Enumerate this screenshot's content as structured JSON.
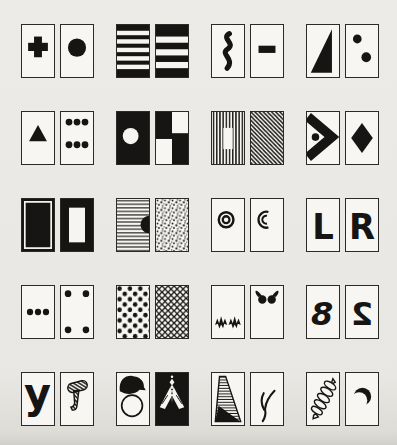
{
  "figure": {
    "kind": "symbol-card-pairs-figure",
    "rows_count": 5,
    "pairs_per_row": 4,
    "cards_per_pair": 2
  },
  "colors": {
    "paper": "#e9e7e3",
    "card": "#f7f6f3",
    "ink": "#161513",
    "border": "#2b2a28",
    "stripe_white": "#f6f5f1"
  },
  "rows": [
    {
      "pairs": [
        {
          "cards": [
            {
              "symbol": "plus"
            },
            {
              "symbol": "filled-circle"
            }
          ]
        },
        {
          "cards": [
            {
              "symbol": "h-stripes-5"
            },
            {
              "symbol": "h-stripes-3"
            }
          ]
        },
        {
          "cards": [
            {
              "symbol": "vertical-squiggle"
            },
            {
              "symbol": "minus-bar"
            }
          ]
        },
        {
          "cards": [
            {
              "symbol": "half-filled-triangle"
            },
            {
              "symbol": "two-dots-diagonal"
            }
          ]
        }
      ]
    },
    {
      "pairs": [
        {
          "cards": [
            {
              "symbol": "triangle-up"
            },
            {
              "symbol": "six-dots"
            }
          ]
        },
        {
          "cards": [
            {
              "symbol": "circle-on-black"
            },
            {
              "symbol": "checkerboard"
            }
          ]
        },
        {
          "cards": [
            {
              "symbol": "vertical-stripes-window"
            },
            {
              "symbol": "diagonal-stripes"
            }
          ]
        },
        {
          "cards": [
            {
              "symbol": "chevron-right-dot"
            },
            {
              "symbol": "diamond"
            }
          ]
        }
      ]
    },
    {
      "pairs": [
        {
          "cards": [
            {
              "symbol": "black-inset-frame"
            },
            {
              "symbol": "thick-black-border"
            }
          ]
        },
        {
          "cards": [
            {
              "symbol": "h-lines-notch"
            },
            {
              "symbol": "stipple"
            }
          ]
        },
        {
          "cards": [
            {
              "symbol": "concentric-rings"
            },
            {
              "symbol": "concentric-arcs"
            }
          ]
        },
        {
          "cards": [
            {
              "symbol": "letter",
              "glyph": "L"
            },
            {
              "symbol": "letter",
              "glyph": "R"
            }
          ]
        }
      ]
    },
    {
      "pairs": [
        {
          "cards": [
            {
              "symbol": "three-dots-row"
            },
            {
              "symbol": "four-dots-corners"
            }
          ]
        },
        {
          "cards": [
            {
              "symbol": "polka-dots"
            },
            {
              "symbol": "crosshatch-lattice"
            }
          ]
        },
        {
          "cards": [
            {
              "symbol": "zigzag-marks"
            },
            {
              "symbol": "butterfly"
            }
          ]
        },
        {
          "cards": [
            {
              "symbol": "letter-italic",
              "glyph": "8"
            },
            {
              "symbol": "letter-mirrored",
              "glyph": "2"
            }
          ]
        }
      ]
    },
    {
      "pairs": [
        {
          "cards": [
            {
              "symbol": "letter-lowercase",
              "glyph": "y"
            },
            {
              "symbol": "hatched-mallet"
            }
          ]
        },
        {
          "cards": [
            {
              "symbol": "bird"
            },
            {
              "symbol": "moth-on-black"
            }
          ]
        },
        {
          "cards": [
            {
              "symbol": "striped-wedge"
            },
            {
              "symbol": "twig"
            }
          ]
        },
        {
          "cards": [
            {
              "symbol": "coil"
            },
            {
              "symbol": "crescent-moon"
            }
          ]
        }
      ]
    }
  ]
}
